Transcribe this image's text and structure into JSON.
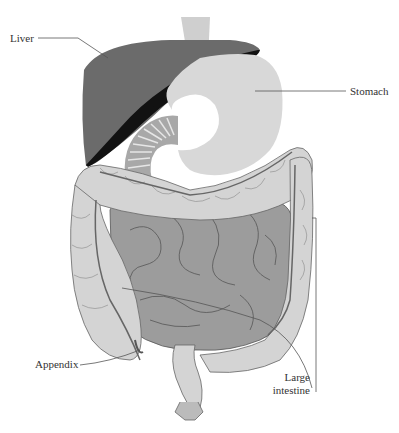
{
  "diagram": {
    "colors": {
      "background": "#ffffff",
      "liver": "#6b6b6b",
      "liver_shadow": "#121212",
      "stomach": "#d8d8d8",
      "esophagus": "#cfcfcf",
      "duodenum": "#a8a8a8",
      "small_intestine": "#9c9c9c",
      "large_intestine": "#d4d4d4",
      "outline": "#555555",
      "leader_line": "#555555",
      "label_text": "#333333"
    },
    "labels": {
      "liver": "Liver",
      "stomach": "Stomach",
      "appendix": "Appendix",
      "large_intestine_line1": "Large",
      "large_intestine_line2": "intestine"
    }
  }
}
